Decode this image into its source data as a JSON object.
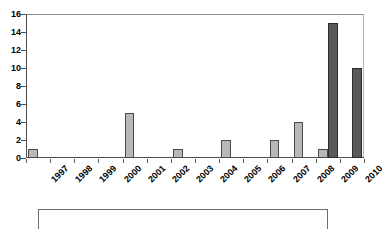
{
  "chart_data": {
    "type": "bar",
    "title": "",
    "subtitle": "",
    "xlabel": "",
    "ylabel": "",
    "categories": [
      "1997",
      "1998",
      "1999",
      "2000",
      "2001",
      "2002",
      "2003",
      "2004",
      "2005",
      "2006",
      "2007",
      "2008",
      "2009",
      "2010"
    ],
    "series": [
      {
        "name": "series-1",
        "color": "#b8b8b8",
        "values": [
          1,
          0,
          0,
          0,
          5,
          0,
          1,
          0,
          2,
          0,
          2,
          4,
          1,
          0
        ]
      },
      {
        "name": "series-2",
        "color": "#595959",
        "values": [
          0,
          0,
          0,
          0,
          0,
          0,
          0,
          0,
          0,
          0,
          0,
          0,
          15,
          10
        ]
      }
    ],
    "ylim": [
      0,
      16
    ],
    "ytick_labels": [
      "0",
      "2",
      "4",
      "6",
      "8",
      "10",
      "12",
      "14",
      "16"
    ],
    "ytick_values": [
      0,
      2,
      4,
      6,
      8,
      10,
      12,
      14,
      16
    ],
    "grid": false,
    "legend_position": "bottom",
    "legend_entries": []
  },
  "colors": {
    "series_light": "#b8b8b8",
    "series_dark": "#595959",
    "axis": "#4d4d4d",
    "text": "#000000",
    "background": "#ffffff"
  }
}
